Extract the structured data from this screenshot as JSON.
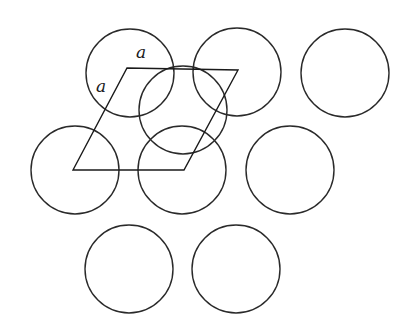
{
  "diagram": {
    "stroke_color": "#2a2a2a",
    "background": "#ffffff",
    "circle_radius": 44,
    "circles": [
      {
        "id": "top-1",
        "cx": 130,
        "cy": 73
      },
      {
        "id": "top-2",
        "cx": 237,
        "cy": 72
      },
      {
        "id": "top-3",
        "cx": 345,
        "cy": 73
      },
      {
        "id": "second-layer",
        "cx": 183,
        "cy": 110
      },
      {
        "id": "mid-1",
        "cx": 75,
        "cy": 170
      },
      {
        "id": "mid-2",
        "cx": 182,
        "cy": 170
      },
      {
        "id": "mid-3",
        "cx": 290,
        "cy": 170
      },
      {
        "id": "bot-1",
        "cx": 129,
        "cy": 269
      },
      {
        "id": "bot-2",
        "cx": 236,
        "cy": 269
      }
    ],
    "unit_cell": {
      "points": [
        [
          73,
          170
        ],
        [
          127,
          68
        ],
        [
          238,
          70
        ],
        [
          184,
          170
        ]
      ]
    },
    "labels": [
      {
        "id": "label-a-top",
        "text": "a",
        "x": 136,
        "y": 58
      },
      {
        "id": "label-a-left",
        "text": "a",
        "x": 96,
        "y": 92
      }
    ]
  }
}
